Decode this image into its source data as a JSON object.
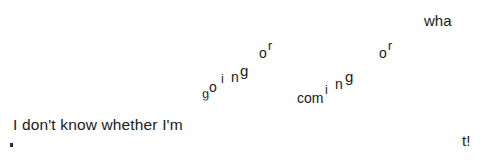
{
  "image": {
    "kind": "scanned-text-illustration",
    "full_sentence": "I don't know whether I'm going or coming or what!",
    "background_color": "#ffffff",
    "text_color": "#1a1a1a",
    "width": 483,
    "height": 160
  },
  "text": {
    "main_line": "I don't know whether I'm",
    "going": {
      "g1": "g",
      "o": "o",
      "i": "i",
      "n": "n",
      "g2": "g"
    },
    "or_first": {
      "o": "o",
      "r": "r"
    },
    "coming": {
      "com": "com",
      "i": "i",
      "n": "n",
      "g": "g"
    },
    "or_second": {
      "o": "o",
      "r": "r"
    },
    "what": {
      "wha": "wha",
      "t_bang": "t!"
    },
    "stray_mark": "."
  }
}
